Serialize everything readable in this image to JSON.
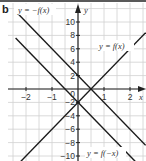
{
  "panel_label": "b",
  "chart_data": {
    "type": "line",
    "title": "",
    "xlabel": "x",
    "ylabel": "y",
    "xlim": [
      -2.4,
      2.6
    ],
    "ylim": [
      -11,
      11
    ],
    "grid": true,
    "x_ticks": [
      -2,
      -1,
      1,
      2
    ],
    "x_tick_labels": [
      "−2",
      "−1",
      "1",
      "2"
    ],
    "y_ticks": [
      10,
      8,
      6,
      4,
      2,
      -2,
      -4,
      -6,
      -8,
      -10
    ],
    "y_tick_labels": [
      "10",
      "8",
      "6",
      "4",
      "2",
      "−2",
      "−4",
      "−6",
      "−8",
      "−10"
    ],
    "origin_label": "0",
    "series": [
      {
        "name": "y = f(x)",
        "equation": "y = 4x − 2",
        "x": [
          -2.4,
          2.6
        ],
        "y": [
          -11.6,
          8.4
        ]
      },
      {
        "name": "y = −f(x)",
        "equation": "y = −4x + 2",
        "x": [
          -2.4,
          2.6
        ],
        "y": [
          11.6,
          -8.4
        ]
      },
      {
        "name": "y = f(−x)",
        "equation": "y = −4x − 2",
        "x": [
          -2.4,
          2.6
        ],
        "y": [
          7.6,
          -12.4
        ]
      }
    ],
    "annotations": [
      {
        "text": "y = −f(x)",
        "position": "top-left"
      },
      {
        "text": "y = f(x)",
        "position": "right-upper"
      },
      {
        "text": "y = f(−x)",
        "position": "bottom"
      }
    ]
  },
  "labels": {
    "neg_f": "y = −f(x)",
    "f": "y = f(x)",
    "f_neg": "y = f(−x)",
    "x_axis": "x",
    "y_axis": "y",
    "origin": "0"
  }
}
